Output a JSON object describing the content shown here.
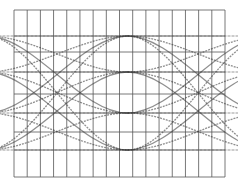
{
  "diagram": {
    "type": "eye-diagram",
    "background": "#ffffff",
    "grid": {
      "left": 14,
      "top": 10,
      "right": 225,
      "bottom": 177,
      "columns": 16,
      "row_lines": [
        10,
        36,
        52,
        72,
        94,
        113,
        132,
        150,
        177
      ],
      "color": "#555555"
    },
    "trace_color": "#333333",
    "levels_y": [
      36,
      72,
      113,
      150
    ],
    "crossing_x": [
      57,
      198
    ],
    "unit_interval_px": 141
  }
}
